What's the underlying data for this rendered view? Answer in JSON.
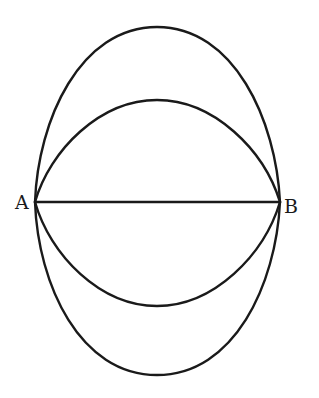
{
  "diagram": {
    "points": {
      "A": {
        "label": "A",
        "x": 35,
        "y": 202
      },
      "B": {
        "label": "B",
        "x": 280,
        "y": 202
      }
    },
    "stroke_color": "#1a1a1a",
    "background": "#ffffff"
  }
}
